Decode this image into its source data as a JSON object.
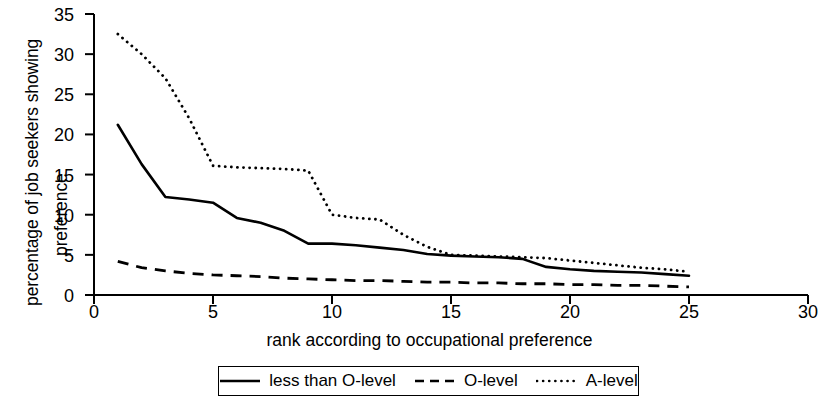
{
  "chart_data": {
    "type": "line",
    "title": "",
    "xlabel": "rank according to occupational preference",
    "ylabel": "percentage of job seekers showing preference",
    "ylabel_line1": "percentage of job seekers showing",
    "ylabel_line2": "preference",
    "xlim": [
      0,
      30
    ],
    "ylim": [
      0,
      35
    ],
    "xticks": [
      0,
      5,
      10,
      15,
      20,
      25,
      30
    ],
    "yticks": [
      0,
      5,
      10,
      15,
      20,
      25,
      30,
      35
    ],
    "xtick_labels": [
      "0",
      "5",
      "10",
      "15",
      "20",
      "25",
      "30"
    ],
    "ytick_labels": [
      "0",
      "5",
      "10",
      "15",
      "20",
      "25",
      "30",
      "35"
    ],
    "grid": false,
    "legend_position": "bottom-center",
    "x": [
      1,
      2,
      3,
      4,
      5,
      6,
      7,
      8,
      9,
      10,
      11,
      12,
      13,
      14,
      15,
      16,
      17,
      18,
      19,
      20,
      21,
      22,
      23,
      24,
      25
    ],
    "series": [
      {
        "name": "less than O-level",
        "style": "solid",
        "color": "#000000",
        "values": [
          21.2,
          16.3,
          12.2,
          11.9,
          11.5,
          9.6,
          9.0,
          8.0,
          6.4,
          6.4,
          6.2,
          5.9,
          5.6,
          5.1,
          4.9,
          4.8,
          4.7,
          4.5,
          3.5,
          3.2,
          3.0,
          2.9,
          2.8,
          2.6,
          2.4
        ]
      },
      {
        "name": "O-level",
        "style": "dashed",
        "color": "#000000",
        "values": [
          4.2,
          3.4,
          3.0,
          2.7,
          2.5,
          2.4,
          2.3,
          2.1,
          2.0,
          1.9,
          1.8,
          1.8,
          1.7,
          1.6,
          1.6,
          1.5,
          1.5,
          1.4,
          1.4,
          1.3,
          1.3,
          1.2,
          1.2,
          1.1,
          1.0
        ]
      },
      {
        "name": "A-level",
        "style": "dotted",
        "color": "#000000",
        "values": [
          32.5,
          30.0,
          27.0,
          22.0,
          16.1,
          15.9,
          15.8,
          15.7,
          15.5,
          10.0,
          9.6,
          9.4,
          7.5,
          6.0,
          5.0,
          4.9,
          4.8,
          4.7,
          4.6,
          4.3,
          4.0,
          3.7,
          3.4,
          3.2,
          2.9
        ]
      }
    ],
    "legend": [
      {
        "label": "less than O-level",
        "style": "solid"
      },
      {
        "label": "O-level",
        "style": "dashed"
      },
      {
        "label": "A-level",
        "style": "dotted"
      }
    ]
  }
}
